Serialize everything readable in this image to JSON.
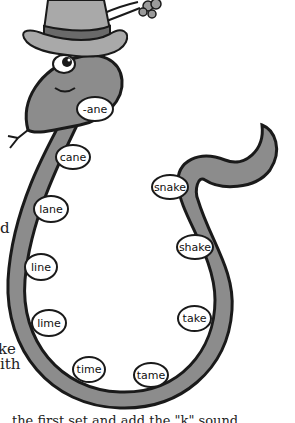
{
  "illustration": {
    "subject": "cartoon snake wearing a top hat",
    "colors": {
      "body": "#8c8c8c",
      "outline": "#1a1a1a",
      "hat": "#a9a9a9",
      "hat_band": "#6a6a6a",
      "bubble": "#ffffff"
    }
  },
  "words": [
    {
      "label": "-ane",
      "x": 76,
      "y": 96,
      "w": 38,
      "h": 26
    },
    {
      "label": "cane",
      "x": 55,
      "y": 144,
      "w": 36,
      "h": 26
    },
    {
      "label": "lane",
      "x": 33,
      "y": 195,
      "w": 36,
      "h": 28
    },
    {
      "label": "line",
      "x": 24,
      "y": 253,
      "w": 34,
      "h": 28
    },
    {
      "label": "lime",
      "x": 31,
      "y": 309,
      "w": 36,
      "h": 28
    },
    {
      "label": "time",
      "x": 72,
      "y": 356,
      "w": 34,
      "h": 27
    },
    {
      "label": "tame",
      "x": 133,
      "y": 362,
      "w": 36,
      "h": 26
    },
    {
      "label": "take",
      "x": 177,
      "y": 305,
      "w": 35,
      "h": 27
    },
    {
      "label": "shake",
      "x": 176,
      "y": 234,
      "w": 38,
      "h": 26
    },
    {
      "label": "snake",
      "x": 151,
      "y": 174,
      "w": 38,
      "h": 26
    }
  ],
  "side_text": [
    {
      "text": "d",
      "x": 0,
      "y": 221
    },
    {
      "text": "ke",
      "x": 0,
      "y": 342
    },
    {
      "text": "ith",
      "x": 0,
      "y": 357
    }
  ],
  "bottom_text": "the first set and add the \"k\" sound"
}
